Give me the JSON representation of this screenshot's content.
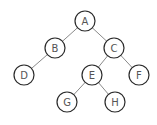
{
  "diagram": {
    "type": "binary-tree",
    "node_radius": 10,
    "nodes": [
      {
        "id": "A",
        "label": "A",
        "x": 85,
        "y": 21
      },
      {
        "id": "B",
        "label": "B",
        "x": 55,
        "y": 48
      },
      {
        "id": "C",
        "label": "C",
        "x": 114,
        "y": 48
      },
      {
        "id": "D",
        "label": "D",
        "x": 24,
        "y": 75
      },
      {
        "id": "E",
        "label": "E",
        "x": 92,
        "y": 75
      },
      {
        "id": "F",
        "label": "F",
        "x": 139,
        "y": 75
      },
      {
        "id": "G",
        "label": "G",
        "x": 67,
        "y": 102
      },
      {
        "id": "H",
        "label": "H",
        "x": 115,
        "y": 102
      }
    ],
    "edges": [
      {
        "from": "A",
        "to": "B"
      },
      {
        "from": "A",
        "to": "C"
      },
      {
        "from": "B",
        "to": "D"
      },
      {
        "from": "C",
        "to": "E"
      },
      {
        "from": "C",
        "to": "F"
      },
      {
        "from": "E",
        "to": "G"
      },
      {
        "from": "E",
        "to": "H"
      }
    ]
  }
}
